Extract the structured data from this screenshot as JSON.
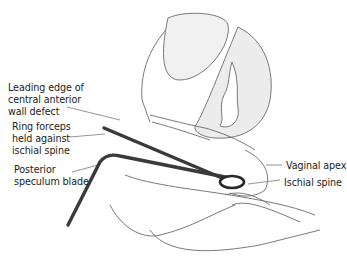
{
  "figure": {
    "labels": {
      "leading_edge": "Leading edge of\ncentral anterior\nwall defect",
      "ring_forceps": "Ring forceps\nheld against\nischial spine",
      "posterior_speculum": "Posterior\nspeculum blade",
      "vaginal_apex": "Vaginal apex",
      "ischial_spine": "Ischial spine"
    }
  }
}
